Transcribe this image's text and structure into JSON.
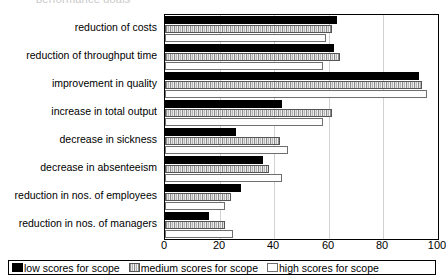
{
  "title_sliver": "performance goals",
  "chart_data": {
    "type": "bar",
    "orientation": "horizontal",
    "title": "",
    "xlabel": "",
    "ylabel": "",
    "xlim": [
      0,
      100
    ],
    "xticks": [
      0,
      20,
      40,
      60,
      80,
      100
    ],
    "grid": true,
    "grid_axis": "x",
    "legend_position": "bottom",
    "categories": [
      "reduction of costs",
      "reduction of throughput time",
      "improvement in quality",
      "increase in total output",
      "decrease in sickness",
      "decrease in absenteeism",
      "reduction in nos. of employees",
      "reduction in nos. of managers"
    ],
    "series": [
      {
        "name": "low scores for scope",
        "color": "#000000",
        "pattern": "solid-black",
        "values": [
          63,
          62,
          93,
          43,
          26,
          36,
          28,
          16
        ]
      },
      {
        "name": "medium scores for scope",
        "color": "#b9b9b9",
        "pattern": "vertical-hatch-gray",
        "values": [
          61,
          64,
          94,
          61,
          42,
          38,
          24,
          22
        ]
      },
      {
        "name": "high scores for scope",
        "color": "#ffffff",
        "pattern": "white-outline",
        "values": [
          59,
          58,
          96,
          58,
          45,
          43,
          22,
          25
        ]
      }
    ]
  },
  "legend": {
    "items": [
      {
        "label": "low scores for scope",
        "swatch": "black-square-icon"
      },
      {
        "label": "medium scores for scope",
        "swatch": "hatched-square-icon"
      },
      {
        "label": "high scores for scope",
        "swatch": "white-square-icon"
      }
    ]
  }
}
